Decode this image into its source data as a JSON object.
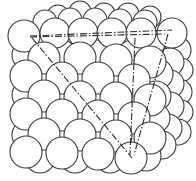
{
  "diagram": {
    "caption": "",
    "colors": {
      "background": "#ffffff",
      "outline": "#3a3a3a",
      "plane_line": "#2a2a2a"
    },
    "elements": {
      "sphere_block": "stacked-spheres",
      "plane_lines": [
        "top-horizontal-dash-dot",
        "front-diagonal-dash-dot",
        "right-vertical-dash-dot-1",
        "right-vertical-dash-dot-2"
      ]
    }
  }
}
